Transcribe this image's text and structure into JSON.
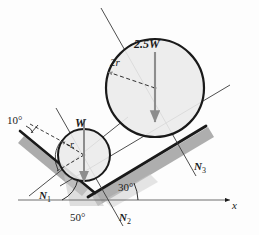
{
  "figure": {
    "background_color": "#fdfdfd",
    "line_color": "#1a1a1a",
    "circle_fill": "#ebebeb",
    "shadow_color": "#9a9a9a",
    "arrow_color": "#8a8a8a"
  },
  "labels": {
    "weight_large": "2.5W",
    "weight_small": "W",
    "radius_large": "2r",
    "radius_small": "r",
    "angle_top_left": "10°",
    "angle_left_incline": "50°",
    "angle_right_incline": "30°",
    "normal_left": "N",
    "normal_left_sub": "1",
    "normal_bottom": "N",
    "normal_bottom_sub": "2",
    "normal_right": "N",
    "normal_right_sub": "3",
    "axis_x": "x"
  },
  "geometry": {
    "large_circle": {
      "cx": 155,
      "cy": 88,
      "r": 49
    },
    "small_circle": {
      "cx": 84,
      "cy": 155,
      "r": 26
    },
    "x_axis": {
      "x1": 18,
      "y1": 200,
      "x2": 232,
      "y2": 200
    },
    "right_incline_angle_deg": 30,
    "left_incline_angle_deg": 50,
    "top_left_angle_deg": 10
  }
}
